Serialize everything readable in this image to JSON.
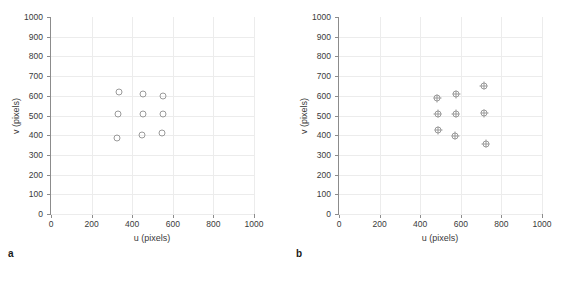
{
  "figure": {
    "background": "#ffffff",
    "axis_color": "#8c8c8c",
    "grid_color": "#ececec",
    "marker_color": "#9a9a9a"
  },
  "chart_data": [
    {
      "type": "scatter",
      "panel": "a",
      "caption": "a",
      "title": "",
      "xlabel": "u (pixels)",
      "ylabel": "v (pixels)",
      "xlim": [
        0,
        1000
      ],
      "ylim": [
        1000,
        0
      ],
      "y_inverted": true,
      "xticks": [
        0,
        200,
        400,
        600,
        800,
        1000
      ],
      "yticks": [
        0,
        100,
        200,
        300,
        400,
        500,
        600,
        700,
        800,
        900,
        1000
      ],
      "xticklabels": [
        "0",
        "200",
        "400",
        "600",
        "800",
        "1000"
      ],
      "yticklabels": [
        "0",
        "100",
        "200",
        "300",
        "400",
        "500",
        "600",
        "700",
        "800",
        "900",
        "1000"
      ],
      "grid": true,
      "legend": false,
      "marker": "open-circle",
      "series": [
        {
          "name": "grid points",
          "points": [
            {
              "u": 325,
              "v": 388
            },
            {
              "u": 450,
              "v": 402
            },
            {
              "u": 548,
              "v": 413
            },
            {
              "u": 330,
              "v": 507
            },
            {
              "u": 452,
              "v": 508
            },
            {
              "u": 550,
              "v": 510
            },
            {
              "u": 335,
              "v": 620
            },
            {
              "u": 455,
              "v": 608
            },
            {
              "u": 552,
              "v": 598
            }
          ]
        }
      ]
    },
    {
      "type": "scatter",
      "panel": "b",
      "caption": "b",
      "title": "",
      "xlabel": "u (pixels)",
      "ylabel": "v (pixels)",
      "xlim": [
        0,
        1000
      ],
      "ylim": [
        1000,
        0
      ],
      "y_inverted": true,
      "xticks": [
        0,
        200,
        400,
        600,
        800,
        1000
      ],
      "yticks": [
        0,
        100,
        200,
        300,
        400,
        500,
        600,
        700,
        800,
        900,
        1000
      ],
      "xticklabels": [
        "0",
        "200",
        "400",
        "600",
        "800",
        "1000"
      ],
      "yticklabels": [
        "0",
        "100",
        "200",
        "300",
        "400",
        "500",
        "600",
        "700",
        "800",
        "900",
        "1000"
      ],
      "grid": true,
      "legend": false,
      "marker": "circled-plus",
      "series": [
        {
          "name": "grid points",
          "points": [
            {
              "u": 490,
              "v": 425
            },
            {
              "u": 572,
              "v": 398
            },
            {
              "u": 723,
              "v": 356
            },
            {
              "u": 487,
              "v": 508
            },
            {
              "u": 575,
              "v": 510
            },
            {
              "u": 715,
              "v": 512
            },
            {
              "u": 485,
              "v": 587
            },
            {
              "u": 578,
              "v": 607
            },
            {
              "u": 712,
              "v": 650
            }
          ]
        }
      ]
    }
  ]
}
